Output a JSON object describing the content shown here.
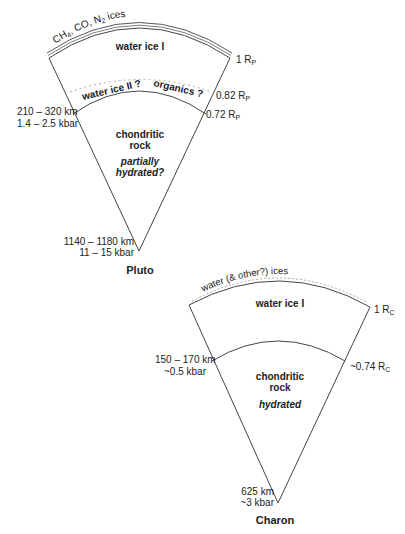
{
  "pluto": {
    "name": "Pluto",
    "surface_label": "CH₄, CO, N₂ ices",
    "layer1": "water ice I",
    "layer2_left": "water ice II ?",
    "layer2_right": "organics ?",
    "core_line1": "chondritic",
    "core_line2": "rock",
    "core_note1": "partially",
    "core_note2": "hydrated?",
    "radius_outer": "1 R",
    "radius_outer_sub": "P",
    "radius_mid": "0.82 R",
    "radius_mid_sub": "P",
    "radius_core": "0.72 R",
    "radius_core_sub": "P",
    "boundary_depth": "210 – 320 km",
    "boundary_pressure": "1.4 – 2.5 kbar",
    "center_depth": "1140 – 1180 km",
    "center_pressure": "11 – 15 kbar"
  },
  "charon": {
    "name": "Charon",
    "surface_label": "water (& other?) ices",
    "layer1": "water ice I",
    "core_line1": "chondritic",
    "core_line2": "rock",
    "core_note": "hydrated",
    "radius_outer": "1 R",
    "radius_outer_sub": "C",
    "radius_core": "~0.74 R",
    "radius_core_sub": "C",
    "boundary_depth": "150 – 170 km",
    "boundary_pressure": "~0.5 kbar",
    "center_depth": "625 km",
    "center_pressure": "~3 kbar"
  },
  "colors": {
    "line": "#333333",
    "dotted": "#999999",
    "text": "#222222"
  }
}
